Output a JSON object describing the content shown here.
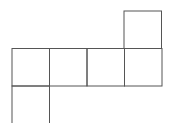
{
  "diagram": {
    "type": "cube-net",
    "stroke_color": "#555555",
    "background": "#ffffff",
    "cell_size": 37.5,
    "faces": [
      {
        "id": "face-top-right",
        "x": 124,
        "y": 11
      },
      {
        "id": "face-row-1",
        "x": 12,
        "y": 48.5
      },
      {
        "id": "face-row-2",
        "x": 49.5,
        "y": 48.5
      },
      {
        "id": "face-row-3",
        "x": 87,
        "y": 48.5
      },
      {
        "id": "face-row-4",
        "x": 124.5,
        "y": 48.5
      },
      {
        "id": "face-bottom-left",
        "x": 12,
        "y": 86
      }
    ]
  }
}
